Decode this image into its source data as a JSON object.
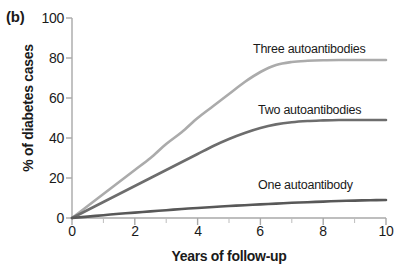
{
  "panel": {
    "label": "(b)"
  },
  "chart_data": {
    "type": "line",
    "title": "",
    "panel_label": "(b)",
    "xlabel": "Years of follow-up",
    "ylabel": "% of diabetes cases",
    "xlim": [
      0,
      10
    ],
    "ylim": [
      0,
      100
    ],
    "xticks": [
      "0",
      "2",
      "4",
      "6",
      "8",
      "10"
    ],
    "xtick_values": [
      0,
      2,
      4,
      6,
      8,
      10
    ],
    "x_minor_ticks": [
      1,
      3,
      5,
      7,
      9
    ],
    "yticks": [
      "0",
      "20",
      "40",
      "60",
      "80",
      "100"
    ],
    "ytick_values": [
      0,
      20,
      40,
      60,
      80,
      100
    ],
    "grid": false,
    "legend": "inline-labels",
    "x": [
      0,
      0.5,
      1,
      1.5,
      2,
      2.5,
      3,
      3.5,
      4,
      4.5,
      5,
      5.5,
      6,
      6.5,
      7,
      7.5,
      8,
      8.5,
      9,
      9.5,
      10
    ],
    "series": [
      {
        "name": "Three autoantibodies",
        "color": "#ababab",
        "plateau": 79,
        "label": "Three autoantibodies",
        "values": [
          0,
          6,
          12,
          18,
          24,
          30,
          37,
          43,
          50,
          56,
          62,
          68,
          73,
          76.5,
          78,
          78.6,
          78.9,
          79,
          79,
          79,
          79
        ]
      },
      {
        "name": "Two autoantibodies",
        "color": "#6d6d6d",
        "plateau": 49,
        "label": "Two autoantibodies",
        "values": [
          0,
          4,
          8,
          12,
          16,
          20,
          24,
          28,
          32,
          36,
          39.5,
          42.5,
          45,
          46.8,
          47.9,
          48.5,
          48.8,
          49,
          49,
          49,
          49
        ]
      },
      {
        "name": "One autoantibody",
        "color": "#585858",
        "plateau": 9,
        "label": "One autoantibody",
        "values": [
          0,
          0.7,
          1.4,
          2.1,
          2.7,
          3.3,
          3.9,
          4.5,
          5.0,
          5.5,
          6.0,
          6.4,
          6.8,
          7.2,
          7.6,
          7.9,
          8.2,
          8.5,
          8.7,
          8.9,
          9
        ]
      }
    ]
  }
}
